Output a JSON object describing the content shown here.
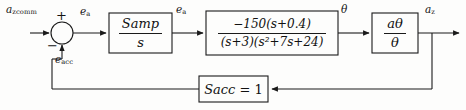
{
  "diagram": {
    "type": "control-system-block-diagram",
    "signals": {
      "input_command": {
        "base": "a",
        "sub": "zcomm",
        "text": "a_zcomm"
      },
      "error_amp_1": {
        "base": "e",
        "sub": "a",
        "text": "e_a"
      },
      "error_amp_2": {
        "base": "e",
        "sub": "a",
        "text": "e_a"
      },
      "theta": {
        "base": "θ",
        "sub": "",
        "text": "θ"
      },
      "output_accel": {
        "base": "a",
        "sub": "z",
        "text": "a_z"
      },
      "feedback": {
        "base": "e",
        "sub": "acc",
        "text": "e_acc"
      }
    },
    "summing_junction": {
      "name": "summing-junction",
      "plus_sign": "+",
      "minus_sign": "−"
    },
    "blocks": [
      {
        "id": "amplifier",
        "kind": "fraction",
        "numerator": {
          "base": "S",
          "sub": "amp"
        },
        "denominator": {
          "base": "s",
          "sub": ""
        },
        "text": "S_amp / s"
      },
      {
        "id": "airframe",
        "kind": "fraction",
        "numerator_text": "−150(s+0.4)",
        "denominator_text": "(s+3)(s²+7s+24)",
        "text": "-150(s+0.4) / ((s+3)(s^2+7s+24))"
      },
      {
        "id": "accel-ratio",
        "kind": "fraction",
        "numerator": {
          "base": "a",
          "sub": "θ"
        },
        "denominator": {
          "base": "θ",
          "sub": ""
        },
        "text": "a_theta / theta"
      },
      {
        "id": "accelerometer",
        "kind": "equation",
        "lhs": {
          "base": "S",
          "sub": "acc"
        },
        "operator": "=",
        "rhs": "1",
        "text": "S_acc = 1"
      }
    ],
    "colors": {
      "stroke": "#1a1a1a",
      "background": "#fdfdfc",
      "text": "#141414"
    }
  }
}
